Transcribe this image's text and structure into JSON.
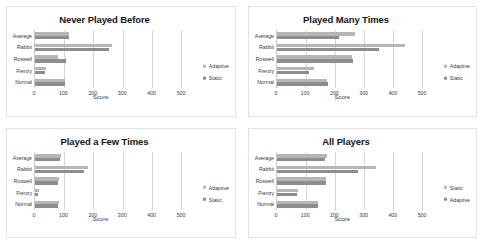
{
  "figure": {
    "panel_count": 4,
    "series_colors": {
      "adaptive": "#b6b6b6",
      "static": "#8d8d8d"
    },
    "background": "#ffffff",
    "frame_color": "#e3e3e3"
  },
  "chart_data": [
    {
      "type": "bar",
      "orientation": "horizontal",
      "title": "Never Played Before",
      "xlabel": "Score",
      "ylabel": "",
      "xlim": [
        0,
        500
      ],
      "xticks": [
        0,
        100,
        200,
        300,
        400,
        500
      ],
      "xtick_labels": [
        "0",
        "100",
        "200",
        "300",
        "400",
        "500"
      ],
      "grid": true,
      "legend_position": "right",
      "categories": [
        "Average",
        "Rabbit",
        "Roswell",
        "Frenzy",
        "Normal"
      ],
      "series": [
        {
          "name": "Adaptive",
          "color": "#b6b6b6",
          "values": [
            118,
            262,
            78,
            38,
            102
          ]
        },
        {
          "name": "Static",
          "color": "#8d8d8d",
          "values": [
            118,
            255,
            105,
            33,
            102
          ]
        }
      ]
    },
    {
      "type": "bar",
      "orientation": "horizontal",
      "title": "Played Many Times",
      "xlabel": "Score",
      "ylabel": "",
      "xlim": [
        0,
        500
      ],
      "xticks": [
        0,
        100,
        200,
        300,
        400,
        500
      ],
      "xtick_labels": [
        "0",
        "100",
        "200",
        "300",
        "400",
        "500"
      ],
      "grid": true,
      "legend_position": "right",
      "categories": [
        "Average",
        "Rabbit",
        "Roswell",
        "Frenzy",
        "Normal"
      ],
      "series": [
        {
          "name": "Adaptive",
          "color": "#b6b6b6",
          "values": [
            268,
            440,
            258,
            128,
            172
          ]
        },
        {
          "name": "Static",
          "color": "#8d8d8d",
          "values": [
            215,
            352,
            262,
            112,
            175
          ]
        }
      ]
    },
    {
      "type": "bar",
      "orientation": "horizontal",
      "title": "Played a Few Times",
      "xlabel": "Score",
      "ylabel": "",
      "xlim": [
        0,
        500
      ],
      "xticks": [
        0,
        100,
        200,
        300,
        400,
        500
      ],
      "xtick_labels": [
        "0",
        "100",
        "200",
        "300",
        "400",
        "500"
      ],
      "grid": true,
      "legend_position": "right",
      "categories": [
        "Average",
        "Rabbit",
        "Roswell",
        "Frenzy",
        "Normal"
      ],
      "series": [
        {
          "name": "Adaptive",
          "color": "#b6b6b6",
          "values": [
            88,
            182,
            82,
            12,
            82
          ]
        },
        {
          "name": "Static",
          "color": "#8d8d8d",
          "values": [
            85,
            168,
            80,
            10,
            80
          ]
        }
      ]
    },
    {
      "type": "bar",
      "orientation": "horizontal",
      "title": "All Players",
      "xlabel": "Score",
      "ylabel": "",
      "xlim": [
        0,
        500
      ],
      "xticks": [
        0,
        100,
        200,
        300,
        400,
        500
      ],
      "xtick_labels": [
        "0",
        "100",
        "200",
        "300",
        "400",
        "500"
      ],
      "grid": true,
      "legend_position": "right",
      "categories": [
        "Average",
        "Rabbit",
        "Roswell",
        "Frenzy",
        "Normal"
      ],
      "series": [
        {
          "name": "Static",
          "color": "#b6b6b6",
          "values": [
            172,
            340,
            168,
            72,
            142
          ]
        },
        {
          "name": "Adaptive",
          "color": "#8d8d8d",
          "values": [
            165,
            278,
            170,
            70,
            140
          ]
        }
      ]
    }
  ]
}
